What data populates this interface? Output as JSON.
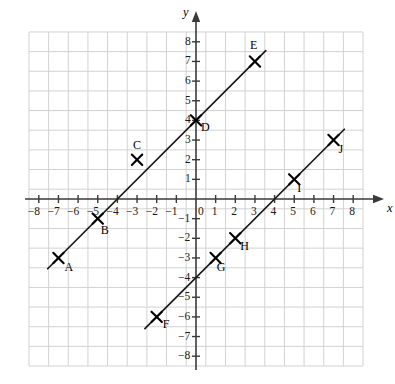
{
  "chart_data": {
    "type": "scatter",
    "title": "",
    "xlabel": "x",
    "ylabel": "y",
    "xlim": [
      -8.5,
      8.5
    ],
    "ylim": [
      -8.5,
      8.5
    ],
    "grid": true,
    "legend": "none",
    "x_ticks": [
      "-8",
      "-7",
      "-6",
      "-5",
      "-4",
      "-3",
      "-2",
      "-1",
      "0",
      "1",
      "2",
      "3",
      "4",
      "5",
      "6",
      "7",
      "8"
    ],
    "y_ticks": [
      "-8",
      "-7",
      "-6",
      "-5",
      "-4",
      "-3",
      "-2",
      "-1",
      "1",
      "2",
      "3",
      "4",
      "5",
      "6",
      "7",
      "8"
    ],
    "origin_label": "0",
    "points": [
      {
        "label": "A",
        "x": -7,
        "y": -3,
        "label_dx": 6,
        "label_dy": 14
      },
      {
        "label": "B",
        "x": -5,
        "y": -1,
        "label_dx": 3,
        "label_dy": 16
      },
      {
        "label": "C",
        "x": -3,
        "y": 2,
        "label_dx": -4,
        "label_dy": -10
      },
      {
        "label": "D",
        "x": 0,
        "y": 4,
        "label_dx": 5,
        "label_dy": 12
      },
      {
        "label": "E",
        "x": 3,
        "y": 7,
        "label_dx": -5,
        "label_dy": -11
      },
      {
        "label": "F",
        "x": -2,
        "y": -6,
        "label_dx": 6,
        "label_dy": 12
      },
      {
        "label": "G",
        "x": 1,
        "y": -3,
        "label_dx": 1,
        "label_dy": 14
      },
      {
        "label": "H",
        "x": 2,
        "y": -2,
        "label_dx": 5,
        "label_dy": 13
      },
      {
        "label": "I",
        "x": 5,
        "y": 1,
        "label_dx": 3,
        "label_dy": 14
      },
      {
        "label": "J",
        "x": 7,
        "y": 3,
        "label_dx": 5,
        "label_dy": 14
      }
    ],
    "series": [
      {
        "name": "line-1",
        "slope": 1,
        "intercept": 4,
        "x_start": -7.55,
        "x_end": 3.55,
        "points": [
          "A",
          "B",
          "C",
          "D",
          "E"
        ]
      },
      {
        "name": "line-2",
        "slope": 1,
        "intercept": -4,
        "x_start": -2.6,
        "x_end": 7.55,
        "points": [
          "F",
          "G",
          "H",
          "I",
          "J"
        ]
      }
    ],
    "colors": {
      "grid": "#d2d2d2",
      "axis": "#3a3a3a",
      "line": "#1a1a1a",
      "marker": "#000000",
      "background": "#ffffff"
    }
  }
}
